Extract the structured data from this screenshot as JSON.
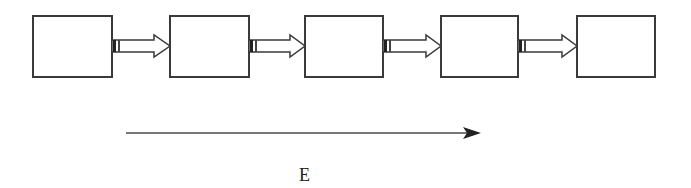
{
  "diagram": {
    "type": "sequential-flow",
    "boxes": [
      {
        "id": "box-1",
        "label": ""
      },
      {
        "id": "box-2",
        "label": ""
      },
      {
        "id": "box-3",
        "label": ""
      },
      {
        "id": "box-4",
        "label": ""
      },
      {
        "id": "box-5",
        "label": ""
      }
    ],
    "connectors": [
      {
        "from": "box-1",
        "to": "box-2",
        "style": "block-arrow"
      },
      {
        "from": "box-2",
        "to": "box-3",
        "style": "block-arrow"
      },
      {
        "from": "box-3",
        "to": "box-4",
        "style": "block-arrow"
      },
      {
        "from": "box-4",
        "to": "box-5",
        "style": "block-arrow"
      }
    ],
    "direction_arrow": {
      "label": "E",
      "direction": "left-to-right"
    },
    "colors": {
      "stroke": "#3a3a3a",
      "background": "#ffffff"
    }
  }
}
